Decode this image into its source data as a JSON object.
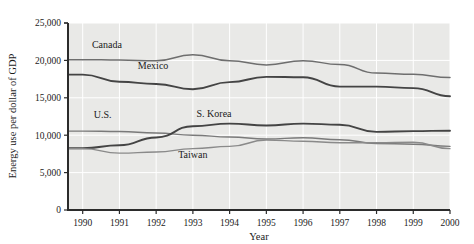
{
  "figure": {
    "background_color": "#ffffff",
    "plot_background_color": "#e9e9e7",
    "gridline_color": "#ffffff",
    "axis_color": "#2b2b2b"
  },
  "chart_data": {
    "type": "line",
    "title": "",
    "xlabel": "Year",
    "ylabel": "Energy use per dollar of GDP",
    "xlim": [
      1989.6,
      2000.0
    ],
    "ylim": [
      0,
      25000
    ],
    "grid": true,
    "legend": "inline-labels",
    "x": [
      1990,
      1991,
      1992,
      1993,
      1994,
      1995,
      1996,
      1997,
      1998,
      1999,
      2000
    ],
    "xtick_labels": [
      "1990",
      "1991",
      "1992",
      "1993",
      "1994",
      "1995",
      "1996",
      "1997",
      "1998",
      "1999",
      "2000"
    ],
    "ytick_labels": [
      "0",
      "5,000",
      "10,000",
      "15,000",
      "20,000",
      "25,000"
    ],
    "ytick_values": [
      0,
      5000,
      10000,
      15000,
      20000,
      25000
    ],
    "series": [
      {
        "name": "Canada",
        "color": "#6e6e6e",
        "width": 1.5,
        "label_x": 1990.25,
        "label_y": 21700,
        "values": [
          20100,
          20050,
          19950,
          20750,
          19950,
          19400,
          19950,
          19450,
          18300,
          18150,
          17700
        ]
      },
      {
        "name": "Mexico",
        "color": "#444444",
        "width": 1.9,
        "label_x": 1991.5,
        "label_y": 18900,
        "values": [
          18100,
          17150,
          16850,
          16150,
          17100,
          17800,
          17750,
          16500,
          16500,
          16300,
          15200
        ]
      },
      {
        "name": "U.S.",
        "color": "#7a7a7a",
        "width": 1.4,
        "label_x": 1990.3,
        "label_y": 12300,
        "values": [
          10550,
          10500,
          10300,
          10000,
          9750,
          9500,
          9650,
          9400,
          8900,
          8800,
          8500
        ]
      },
      {
        "name": "S. Korea",
        "color": "#444444",
        "width": 1.9,
        "label_x": 1993.1,
        "label_y": 12500,
        "values": [
          8250,
          8650,
          9700,
          11200,
          11550,
          11300,
          11550,
          11400,
          10450,
          10550,
          10600
        ]
      },
      {
        "name": "Taiwan",
        "color": "#8a8a8a",
        "width": 1.4,
        "label_x": 1992.6,
        "label_y": 6900,
        "values": [
          8200,
          7600,
          7750,
          8200,
          8500,
          9350,
          9200,
          9000,
          9000,
          9050,
          8200
        ]
      }
    ]
  }
}
